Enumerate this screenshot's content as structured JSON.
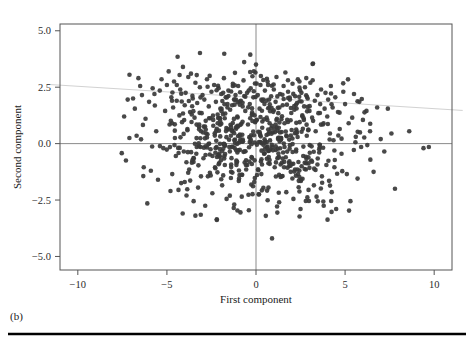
{
  "figure": {
    "caption": "(b)",
    "rule_color": "#000000",
    "background": "#ffffff"
  },
  "chart_data": {
    "type": "scatter",
    "title": "",
    "subtitle": "",
    "xlabel": "First component",
    "ylabel": "Second component",
    "xlim": [
      -11.0,
      11.0
    ],
    "ylim": [
      -5.6,
      5.3
    ],
    "xticks": [
      -10,
      -5,
      0,
      5,
      10
    ],
    "xtick_labels": [
      "−10",
      "−5",
      "0",
      "5",
      "10"
    ],
    "yticks": [
      5.0,
      2.5,
      0.0,
      -2.5,
      -5.0
    ],
    "ytick_labels": [
      "5.0",
      "2.5",
      "0.0",
      "−2.5",
      "−5.0"
    ],
    "grid": false,
    "legend": "none",
    "marker": {
      "shape": "circle",
      "color": "#3a3a3a",
      "size_px": 4.6,
      "opacity": 0.92
    },
    "reference_lines": [
      {
        "name": "vertical-zero-line",
        "orientation": "vertical",
        "value": 0,
        "color": "#7d7d7d",
        "width": 0.9
      },
      {
        "name": "horizontal-zero-line",
        "orientation": "horizontal",
        "value": 0,
        "color": "#7d7d7d",
        "width": 0.9
      }
    ],
    "trend_line": {
      "name": "regression-line",
      "color": "#d2d2d2",
      "width": 1.0,
      "x_start": -11.6,
      "y_start": 2.62,
      "x_end": 11.6,
      "y_end": 1.47,
      "extends_beyond_axes": true
    },
    "frame": {
      "color": "#555555",
      "width": 1.0
    },
    "n_points": 760,
    "x": [
      -7.4,
      -7.3,
      -7.2,
      -7.1,
      -6.9,
      -6.8,
      -6.7,
      -6.6,
      -6.5,
      -6.4,
      -6.3,
      -6.2,
      -6.1,
      -6.0,
      -5.9,
      -5.8,
      -5.7,
      -5.6,
      -5.5,
      -5.4,
      -5.3,
      -5.2,
      -5.1,
      -5.0,
      -4.9,
      -4.85,
      -4.8,
      -4.75,
      -4.7,
      -4.65,
      -4.6,
      -4.55,
      -4.5,
      -4.45,
      -4.4,
      -4.35,
      -4.3,
      -4.25,
      -4.2,
      -4.15,
      -4.1,
      -4.05,
      -4.0,
      -3.95,
      -3.9,
      -3.85,
      -3.8,
      -3.75,
      -3.7,
      -3.65,
      -3.6,
      -3.55,
      -3.5,
      -3.45,
      -3.4,
      -3.35,
      -3.3,
      -3.25,
      -3.2,
      -3.15,
      -3.1,
      -3.05,
      -3.0,
      -2.95,
      -2.9,
      -2.85,
      -2.8,
      -2.75,
      -2.7,
      -2.65,
      -2.6,
      -2.55,
      -2.5,
      -2.45,
      -2.4,
      -2.35,
      -2.3,
      -2.25,
      -2.2,
      -2.15,
      -2.1,
      -2.05,
      -2.0,
      -1.95,
      -1.9,
      -1.85,
      -1.8,
      -1.75,
      -1.7,
      -1.65,
      -1.6,
      -1.55,
      -1.5,
      -1.45,
      -1.4,
      -1.35,
      -1.3,
      -1.25,
      -1.2,
      -1.15,
      -1.1,
      -1.05,
      -1.0,
      -0.95,
      -0.9,
      -0.85,
      -0.8,
      -0.75,
      -0.7,
      -0.65,
      -0.6,
      -0.55,
      -0.5,
      -0.45,
      -0.4,
      -0.35,
      -0.3,
      -0.25,
      -0.2,
      -0.15,
      -0.1,
      -0.05,
      0.0,
      0.05,
      0.1,
      0.15,
      0.2,
      0.25,
      0.3,
      0.35,
      0.4,
      0.45,
      0.5,
      0.55,
      0.6,
      0.65,
      0.7,
      0.75,
      0.8,
      0.85,
      0.9,
      0.95,
      1.0,
      1.05,
      1.1,
      1.15,
      1.2,
      1.25,
      1.3,
      1.35,
      1.4,
      1.45,
      1.5,
      1.55,
      1.6,
      1.65,
      1.7,
      1.75,
      1.8,
      1.85,
      1.9,
      1.95,
      2.0,
      2.05,
      2.1,
      2.15,
      2.2,
      2.25,
      2.3,
      2.35,
      2.4,
      2.45,
      2.5,
      2.55,
      2.6,
      2.65,
      2.7,
      2.75,
      2.8,
      2.85,
      2.9,
      2.95,
      3.0,
      3.05,
      3.1,
      3.15,
      3.2,
      3.25,
      3.3,
      3.35,
      3.4,
      3.45,
      3.5,
      3.55,
      3.6,
      3.65,
      3.7,
      3.75,
      3.8,
      3.85,
      3.9,
      3.95,
      4.0,
      4.05,
      4.1,
      4.15,
      4.2,
      4.25,
      4.3,
      4.35,
      4.4,
      4.45,
      4.5,
      4.6,
      4.7,
      4.8,
      4.9,
      5.0,
      5.1,
      5.2,
      5.3,
      5.4,
      5.5,
      5.6,
      5.7,
      5.8,
      5.9,
      6.0,
      6.2,
      6.4,
      6.6,
      6.8,
      7.0,
      7.2,
      7.4,
      7.6,
      7.8,
      8.6,
      9.4,
      9.7
    ],
    "y": [
      1.2,
      -0.75,
      1.95,
      3.05,
      2.0,
      1.55,
      0.35,
      2.9,
      2.55,
      2.15,
      -1.05,
      1.1,
      -2.65,
      1.85,
      -1.2,
      2.45,
      2.2,
      0.55,
      -1.6,
      2.35,
      2.85,
      -0.2,
      1.45,
      2.6,
      3.2,
      0.85,
      -2.1,
      2.05,
      -1.35,
      1.6,
      2.75,
      0.25,
      -0.55,
      1.9,
      3.85,
      -2.05,
      1.25,
      2.4,
      -1.75,
      0.95,
      3.4,
      -0.35,
      1.7,
      2.25,
      -2.3,
      0.65,
      2.95,
      -1.15,
      1.4,
      3.1,
      -0.85,
      2.0,
      -2.55,
      1.15,
      2.7,
      -0.45,
      1.8,
      -1.95,
      0.75,
      2.5,
      -3.15,
      1.35,
      2.15,
      -0.65,
      1.95,
      -2.75,
      0.45,
      2.85,
      -1.45,
      1.65,
      3.0,
      -0.25,
      2.3,
      -2.2,
      1.05,
      2.6,
      -1.05,
      1.85,
      -3.35,
      0.9,
      2.45,
      -0.55,
      1.55,
      2.2,
      -1.85,
      1.3,
      2.9,
      -0.95,
      2.05,
      -2.45,
      1.75,
      2.35,
      -0.15,
      1.5,
      -1.25,
      0.6,
      2.65,
      -2.85,
      1.95,
      2.15,
      -0.75,
      1.2,
      2.55,
      -1.55,
      0.4,
      1.9,
      -2.35,
      1.65,
      2.8,
      -0.35,
      1.45,
      -1.15,
      2.25,
      0.85,
      -2.95,
      1.75,
      2.45,
      -0.6,
      1.3,
      2.05,
      -1.7,
      0.95,
      3.5,
      -0.05,
      2.15,
      -2.25,
      1.55,
      2.6,
      -1.35,
      0.7,
      1.95,
      -0.45,
      2.35,
      -3.2,
      1.15,
      2.75,
      -1.95,
      1.6,
      -0.25,
      2.1,
      -4.2,
      0.5,
      2.4,
      -1.05,
      1.85,
      2.95,
      -0.65,
      1.35,
      -2.6,
      2.2,
      0.25,
      -1.45,
      1.7,
      2.55,
      -0.15,
      3.15,
      -2.15,
      1.05,
      2.3,
      -0.85,
      1.95,
      -1.25,
      0.6,
      2.65,
      -2.45,
      1.5,
      2.1,
      -0.35,
      1.8,
      2.85,
      -1.65,
      0.95,
      -2.9,
      2.25,
      1.25,
      -0.55,
      1.65,
      2.5,
      -1.15,
      0.35,
      2.0,
      -2.05,
      1.45,
      2.7,
      -0.75,
      1.15,
      3.55,
      -1.85,
      1.9,
      0.55,
      -2.35,
      2.15,
      1.35,
      -0.25,
      1.75,
      2.4,
      -1.45,
      0.85,
      -2.75,
      1.55,
      2.25,
      -0.95,
      1.2,
      1.95,
      -1.65,
      0.45,
      2.55,
      -2.15,
      1.6,
      0.15,
      -1.05,
      2.05,
      -2.9,
      1.4,
      0.65,
      -0.45,
      2.3,
      1.75,
      -1.35,
      0.9,
      -2.55,
      1.15,
      2.2,
      0.3,
      -1.55,
      1.85,
      -0.15,
      1.05,
      1.45,
      0.55,
      -1.25,
      1.6,
      0.2,
      -0.35,
      1.55,
      0.45,
      -2.0,
      0.55,
      -0.2,
      -0.15
    ]
  }
}
